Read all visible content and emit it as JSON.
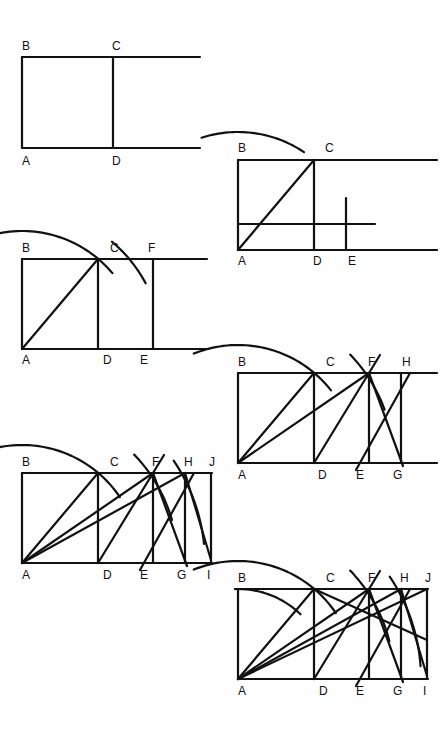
{
  "page": {
    "background_color": "#fefefe",
    "ink_color": "#111111",
    "width": 448,
    "height": 732,
    "label_font_size": 12,
    "stroke_width": 2.2
  },
  "figures": [
    {
      "id": "figure-1",
      "name": "square-abcd",
      "caption": "Square ABCD with extended base and top lines",
      "origin": {
        "x": 22,
        "y": 148
      },
      "unit": 91,
      "extend": 88,
      "labels": [
        {
          "text": "B",
          "x": 22,
          "y": 50
        },
        {
          "text": "C",
          "x": 112,
          "y": 50
        },
        {
          "text": "A",
          "x": 22,
          "y": 165
        },
        {
          "text": "D",
          "x": 112,
          "y": 165
        }
      ],
      "segments": [
        {
          "name": "base-line",
          "x1": 22,
          "y1": 148,
          "x2": 200,
          "y2": 148
        },
        {
          "name": "top-line",
          "x1": 22,
          "y1": 57,
          "x2": 200,
          "y2": 57
        },
        {
          "name": "side-ab",
          "x1": 22,
          "y1": 57,
          "x2": 22,
          "y2": 148
        },
        {
          "name": "side-cd",
          "x1": 113,
          "y1": 57,
          "x2": 113,
          "y2": 148
        }
      ],
      "arcs": [],
      "diagonals": []
    },
    {
      "id": "figure-2",
      "name": "root-two-step",
      "caption": "Diagonal AC swung by arc to E giving root-2 rectangle",
      "origin": {
        "x": 238,
        "y": 250
      },
      "unit": 76,
      "labels": [
        {
          "text": "B",
          "x": 238,
          "y": 152
        },
        {
          "text": "C",
          "x": 325,
          "y": 152
        },
        {
          "text": "A",
          "x": 238,
          "y": 265
        },
        {
          "text": "D",
          "x": 313,
          "y": 265
        },
        {
          "text": "E",
          "x": 348,
          "y": 265
        }
      ],
      "segments": [
        {
          "name": "base-line",
          "x1": 238,
          "y1": 250,
          "x2": 437,
          "y2": 250
        },
        {
          "name": "top-line",
          "x1": 238,
          "y1": 160,
          "x2": 437,
          "y2": 160
        },
        {
          "name": "side-ab",
          "x1": 238,
          "y1": 160,
          "x2": 238,
          "y2": 250
        },
        {
          "name": "side-cd",
          "x1": 314,
          "y1": 160,
          "x2": 314,
          "y2": 250
        },
        {
          "name": "inner-horizontal",
          "x1": 238,
          "y1": 224,
          "x2": 375,
          "y2": 224
        },
        {
          "name": "vertical-at-e",
          "x1": 346,
          "y1": 198,
          "x2": 346,
          "y2": 250
        }
      ],
      "diagonals": [
        {
          "name": "diagonal-ac",
          "x1": 238,
          "y1": 250,
          "x2": 314,
          "y2": 160
        }
      ],
      "arcs": [
        {
          "name": "arc-c-to-e",
          "cx": 238,
          "cy": 250,
          "r": 118,
          "start_deg": 108,
          "end_deg": 56
        }
      ]
    },
    {
      "id": "figure-3",
      "name": "root-three-step",
      "caption": "Second arc from E up to F giving root-3 rectangle",
      "origin": {
        "x": 22,
        "y": 349
      },
      "unit": 76,
      "labels": [
        {
          "text": "B",
          "x": 22,
          "y": 252
        },
        {
          "text": "C",
          "x": 110,
          "y": 252
        },
        {
          "text": "F",
          "x": 148,
          "y": 252
        },
        {
          "text": "A",
          "x": 22,
          "y": 364
        },
        {
          "text": "D",
          "x": 103,
          "y": 364
        },
        {
          "text": "E",
          "x": 140,
          "y": 364
        }
      ],
      "segments": [
        {
          "name": "base-line",
          "x1": 22,
          "y1": 349,
          "x2": 207,
          "y2": 349
        },
        {
          "name": "top-line",
          "x1": 22,
          "y1": 259,
          "x2": 207,
          "y2": 259
        },
        {
          "name": "side-ab",
          "x1": 22,
          "y1": 259,
          "x2": 22,
          "y2": 349
        },
        {
          "name": "side-cd",
          "x1": 98,
          "y1": 259,
          "x2": 98,
          "y2": 349
        },
        {
          "name": "side-fe",
          "x1": 153,
          "y1": 259,
          "x2": 153,
          "y2": 349
        }
      ],
      "diagonals": [
        {
          "name": "diagonal-ac",
          "x1": 22,
          "y1": 349,
          "x2": 98,
          "y2": 259
        }
      ],
      "arcs": [
        {
          "name": "arc-c-to-e",
          "cx": 22,
          "cy": 349,
          "r": 118,
          "start_deg": 110,
          "end_deg": 40
        },
        {
          "name": "arc-e-to-f",
          "cx": 22,
          "cy": 349,
          "r": 140,
          "start_deg": 50,
          "end_deg": 28
        }
      ]
    },
    {
      "id": "figure-4",
      "name": "root-four-step",
      "caption": "Third arc from G up to H giving root-4 rectangle",
      "origin": {
        "x": 238,
        "y": 463
      },
      "unit": 76,
      "labels": [
        {
          "text": "B",
          "x": 238,
          "y": 366
        },
        {
          "text": "C",
          "x": 326,
          "y": 366
        },
        {
          "text": "F",
          "x": 368,
          "y": 366
        },
        {
          "text": "H",
          "x": 402,
          "y": 366
        },
        {
          "text": "A",
          "x": 238,
          "y": 479
        },
        {
          "text": "D",
          "x": 318,
          "y": 479
        },
        {
          "text": "E",
          "x": 356,
          "y": 479
        },
        {
          "text": "G",
          "x": 393,
          "y": 479
        }
      ],
      "segments": [
        {
          "name": "base-line",
          "x1": 238,
          "y1": 463,
          "x2": 437,
          "y2": 463
        },
        {
          "name": "top-line",
          "x1": 238,
          "y1": 373,
          "x2": 437,
          "y2": 373
        },
        {
          "name": "side-ab",
          "x1": 238,
          "y1": 373,
          "x2": 238,
          "y2": 463
        },
        {
          "name": "side-cd",
          "x1": 314,
          "y1": 373,
          "x2": 314,
          "y2": 463
        },
        {
          "name": "side-fe",
          "x1": 369,
          "y1": 373,
          "x2": 369,
          "y2": 463
        },
        {
          "name": "side-hg",
          "x1": 401,
          "y1": 373,
          "x2": 401,
          "y2": 463
        }
      ],
      "diagonals": [
        {
          "name": "diagonal-ac",
          "x1": 238,
          "y1": 463,
          "x2": 314,
          "y2": 373
        },
        {
          "name": "diagonal-af",
          "x1": 238,
          "y1": 463,
          "x2": 369,
          "y2": 373
        },
        {
          "name": "chord-d-to-f",
          "x1": 314,
          "y1": 463,
          "x2": 380,
          "y2": 355
        },
        {
          "name": "chord-e-to-h",
          "x1": 356,
          "y1": 470,
          "x2": 410,
          "y2": 373
        },
        {
          "name": "chord-f-to-g",
          "x1": 369,
          "y1": 373,
          "x2": 403,
          "y2": 466
        }
      ],
      "arcs": [
        {
          "name": "arc-c-to-e",
          "cx": 238,
          "cy": 463,
          "r": 118,
          "start_deg": 112,
          "end_deg": 38
        },
        {
          "name": "arc-f-to-g",
          "cx": 238,
          "cy": 463,
          "r": 156,
          "start_deg": 44,
          "end_deg": 20
        }
      ]
    },
    {
      "id": "figure-5",
      "name": "root-five-step",
      "caption": "Fourth arc from I up to J giving root-5 rectangle",
      "origin": {
        "x": 22,
        "y": 563
      },
      "unit": 76,
      "labels": [
        {
          "text": "B",
          "x": 22,
          "y": 466
        },
        {
          "text": "C",
          "x": 110,
          "y": 466
        },
        {
          "text": "F",
          "x": 152,
          "y": 466
        },
        {
          "text": "H",
          "x": 184,
          "y": 466
        },
        {
          "text": "J",
          "x": 209,
          "y": 466
        },
        {
          "text": "A",
          "x": 22,
          "y": 579
        },
        {
          "text": "D",
          "x": 103,
          "y": 579
        },
        {
          "text": "E",
          "x": 140,
          "y": 579
        },
        {
          "text": "G",
          "x": 177,
          "y": 579
        },
        {
          "text": "I",
          "x": 207,
          "y": 579
        }
      ],
      "segments": [
        {
          "name": "base-line",
          "x1": 22,
          "y1": 563,
          "x2": 212,
          "y2": 563
        },
        {
          "name": "top-line",
          "x1": 22,
          "y1": 473,
          "x2": 212,
          "y2": 473
        },
        {
          "name": "side-ab",
          "x1": 22,
          "y1": 473,
          "x2": 22,
          "y2": 563
        },
        {
          "name": "side-cd",
          "x1": 98,
          "y1": 473,
          "x2": 98,
          "y2": 563
        },
        {
          "name": "side-fe",
          "x1": 153,
          "y1": 473,
          "x2": 153,
          "y2": 563
        },
        {
          "name": "side-hg",
          "x1": 185,
          "y1": 473,
          "x2": 185,
          "y2": 563
        },
        {
          "name": "side-ji",
          "x1": 211,
          "y1": 473,
          "x2": 211,
          "y2": 563
        }
      ],
      "diagonals": [
        {
          "name": "diagonal-ac",
          "x1": 22,
          "y1": 563,
          "x2": 98,
          "y2": 473
        },
        {
          "name": "diagonal-af",
          "x1": 22,
          "y1": 563,
          "x2": 153,
          "y2": 473
        },
        {
          "name": "diagonal-ah",
          "x1": 22,
          "y1": 563,
          "x2": 185,
          "y2": 473
        },
        {
          "name": "chord-d-to-f",
          "x1": 98,
          "y1": 563,
          "x2": 164,
          "y2": 455
        },
        {
          "name": "chord-e-to-h",
          "x1": 140,
          "y1": 570,
          "x2": 194,
          "y2": 473
        },
        {
          "name": "chord-f-to-g",
          "x1": 153,
          "y1": 473,
          "x2": 187,
          "y2": 566
        },
        {
          "name": "chord-h-to-i",
          "x1": 185,
          "y1": 473,
          "x2": 211,
          "y2": 560
        }
      ],
      "arcs": [
        {
          "name": "arc-c-to-e",
          "cx": 22,
          "cy": 563,
          "r": 118,
          "start_deg": 112,
          "end_deg": 34
        },
        {
          "name": "arc-f-to-g",
          "cx": 22,
          "cy": 563,
          "r": 156,
          "start_deg": 44,
          "end_deg": 16
        },
        {
          "name": "arc-h-to-i",
          "cx": 22,
          "cy": 563,
          "r": 183,
          "start_deg": 34,
          "end_deg": 6
        }
      ]
    },
    {
      "id": "figure-6",
      "name": "root-five-complete",
      "caption": "Completed root-5 rectangle with all arcs and diagonals",
      "origin": {
        "x": 238,
        "y": 679
      },
      "unit": 76,
      "labels": [
        {
          "text": "B",
          "x": 238,
          "y": 582
        },
        {
          "text": "C",
          "x": 326,
          "y": 582
        },
        {
          "text": "F",
          "x": 368,
          "y": 582
        },
        {
          "text": "H",
          "x": 400,
          "y": 582
        },
        {
          "text": "J",
          "x": 425,
          "y": 582
        },
        {
          "text": "A",
          "x": 238,
          "y": 695
        },
        {
          "text": "D",
          "x": 319,
          "y": 695
        },
        {
          "text": "E",
          "x": 356,
          "y": 695
        },
        {
          "text": "G",
          "x": 393,
          "y": 695
        },
        {
          "text": "I",
          "x": 423,
          "y": 695
        }
      ],
      "segments": [
        {
          "name": "base-line",
          "x1": 238,
          "y1": 679,
          "x2": 428,
          "y2": 679
        },
        {
          "name": "top-line",
          "x1": 238,
          "y1": 589,
          "x2": 428,
          "y2": 589
        },
        {
          "name": "side-ab",
          "x1": 238,
          "y1": 589,
          "x2": 238,
          "y2": 679
        },
        {
          "name": "side-cd",
          "x1": 314,
          "y1": 589,
          "x2": 314,
          "y2": 679
        },
        {
          "name": "side-fe",
          "x1": 369,
          "y1": 589,
          "x2": 369,
          "y2": 679
        },
        {
          "name": "side-hg",
          "x1": 401,
          "y1": 589,
          "x2": 401,
          "y2": 679
        },
        {
          "name": "side-ji",
          "x1": 427,
          "y1": 589,
          "x2": 427,
          "y2": 679
        }
      ],
      "diagonals": [
        {
          "name": "diagonal-ac",
          "x1": 238,
          "y1": 679,
          "x2": 314,
          "y2": 589
        },
        {
          "name": "diagonal-af",
          "x1": 238,
          "y1": 679,
          "x2": 369,
          "y2": 589
        },
        {
          "name": "diagonal-ah",
          "x1": 238,
          "y1": 679,
          "x2": 401,
          "y2": 589
        },
        {
          "name": "diagonal-aj",
          "x1": 238,
          "y1": 679,
          "x2": 427,
          "y2": 589
        },
        {
          "name": "chord-d-to-f",
          "x1": 314,
          "y1": 679,
          "x2": 380,
          "y2": 571
        },
        {
          "name": "chord-e-to-h",
          "x1": 356,
          "y1": 686,
          "x2": 410,
          "y2": 589
        },
        {
          "name": "chord-f-to-g",
          "x1": 369,
          "y1": 589,
          "x2": 403,
          "y2": 682
        },
        {
          "name": "chord-h-to-i",
          "x1": 401,
          "y1": 589,
          "x2": 427,
          "y2": 676
        },
        {
          "name": "chord-c-to-j",
          "x1": 314,
          "y1": 589,
          "x2": 427,
          "y2": 640
        }
      ],
      "arcs": [
        {
          "name": "arc-b-to-c",
          "cx": 238,
          "cy": 679,
          "r": 90,
          "start_deg": 92,
          "end_deg": 46
        },
        {
          "name": "arc-c-to-e",
          "cx": 238,
          "cy": 679,
          "r": 118,
          "start_deg": 112,
          "end_deg": 34
        },
        {
          "name": "arc-f-to-g",
          "cx": 238,
          "cy": 679,
          "r": 156,
          "start_deg": 44,
          "end_deg": 14
        },
        {
          "name": "arc-h-to-i",
          "cx": 238,
          "cy": 679,
          "r": 183,
          "start_deg": 34,
          "end_deg": 4
        }
      ]
    }
  ]
}
